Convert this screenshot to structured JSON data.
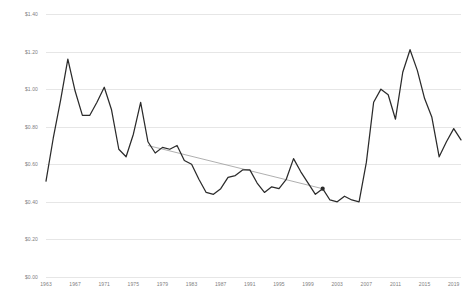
{
  "chart_data": {
    "type": "line",
    "title": "",
    "subtitle": "",
    "xlabel": "",
    "ylabel": "",
    "xlim": [
      1963,
      2020
    ],
    "ylim": [
      0.0,
      1.4
    ],
    "grid": true,
    "legend": false,
    "y_tick_labels": [
      "$1.40",
      "$1.20",
      "$1.00",
      "$0.80",
      "$0.60",
      "$0.40",
      "$0.20",
      "$0.00"
    ],
    "y_tick_values": [
      1.4,
      1.2,
      1.0,
      0.8,
      0.6,
      0.4,
      0.2,
      0.0
    ],
    "x_tick_labels": [
      "1963",
      "1967",
      "1971",
      "1975",
      "1979",
      "1983",
      "1987",
      "1991",
      "1995",
      "1999",
      "2003",
      "2007",
      "2011",
      "2015",
      "2019"
    ],
    "x_tick_values": [
      1963,
      1967,
      1971,
      1975,
      1979,
      1983,
      1987,
      1991,
      1995,
      1999,
      2003,
      2007,
      2011,
      2015,
      2019
    ],
    "series": [
      {
        "name": "price",
        "color": "#2b2b2b",
        "x": [
          1963,
          1964,
          1965,
          1966,
          1967,
          1968,
          1969,
          1970,
          1971,
          1972,
          1973,
          1974,
          1975,
          1976,
          1977,
          1978,
          1979,
          1980,
          1981,
          1982,
          1983,
          1984,
          1985,
          1986,
          1987,
          1988,
          1989,
          1990,
          1991,
          1992,
          1993,
          1994,
          1995,
          1996,
          1997,
          1998,
          1999,
          2000,
          2001,
          2002,
          2003,
          2004,
          2005,
          2006,
          2007,
          2008,
          2009,
          2010,
          2011,
          2012,
          2013,
          2014,
          2015,
          2016,
          2017,
          2018,
          2019,
          2020
        ],
        "y": [
          0.51,
          0.74,
          0.94,
          1.16,
          0.99,
          0.86,
          0.86,
          0.93,
          1.01,
          0.89,
          0.68,
          0.64,
          0.76,
          0.93,
          0.72,
          0.66,
          0.69,
          0.68,
          0.7,
          0.62,
          0.6,
          0.52,
          0.45,
          0.44,
          0.47,
          0.53,
          0.54,
          0.57,
          0.57,
          0.5,
          0.45,
          0.48,
          0.47,
          0.52,
          0.63,
          0.56,
          0.5,
          0.44,
          0.47,
          0.41,
          0.4,
          0.43,
          0.41,
          0.4,
          0.61,
          0.93,
          1.0,
          0.97,
          0.84,
          1.09,
          1.21,
          1.1,
          0.95,
          0.85,
          0.64,
          0.72,
          0.79,
          0.73
        ]
      }
    ],
    "trendline": {
      "name": "linear-trend",
      "color": "#9a9a9a",
      "x_start": 1977,
      "x_end": 2001,
      "y_start": 0.7,
      "y_end": 0.47,
      "endpoint_marker": true
    }
  }
}
